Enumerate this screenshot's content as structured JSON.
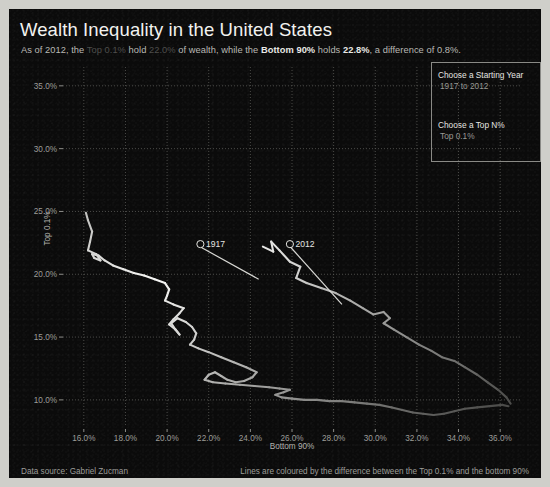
{
  "title": "Wealth Inequality in the United States",
  "subtitle": {
    "p1": "As of 2012, the ",
    "dim1": "Top 0.1%",
    "p2": " hold ",
    "dim2": "22.0%",
    "p3": " of wealth, while the ",
    "bold1": "Bottom 90%",
    "p4": " holds ",
    "bold2": "22.8%",
    "p5": ", a difference of 0.8%."
  },
  "controls": {
    "year_label": "Choose a Starting Year",
    "year_value": "1917 to 2012",
    "topn_label": "Choose a Top N%",
    "topn_value": "Top 0.1%"
  },
  "footer": {
    "left": "Data source: Gabriel Zucman",
    "right": "Lines are coloured by the difference between the Top 0.1% and the bottom 90%"
  },
  "colors": {
    "background": "#0b0b0b",
    "frame": "#cfcfca",
    "grid": "#5a5a57",
    "line_bright": "#f6f6f3",
    "line_dim": "#4a4a48",
    "text": "#e6e6e2",
    "muted": "#9d9d99"
  },
  "chart_data": {
    "type": "line",
    "title": "Wealth Inequality in the United States",
    "xlabel": "Bottom 90%",
    "ylabel": "Top 0.1%",
    "xlim": [
      15.0,
      37.0
    ],
    "ylim": [
      8.0,
      36.5
    ],
    "xticks": [
      "16.0%",
      "18.0%",
      "20.0%",
      "22.0%",
      "24.0%",
      "26.0%",
      "28.0%",
      "30.0%",
      "32.0%",
      "34.0%",
      "36.0%"
    ],
    "xtickvals": [
      16,
      18,
      20,
      22,
      24,
      26,
      28,
      30,
      32,
      34,
      36
    ],
    "yticks": [
      "35.0%",
      "30.0%",
      "25.0%",
      "20.0%",
      "15.0%",
      "10.0%"
    ],
    "ytickvals": [
      35,
      30,
      25,
      20,
      15,
      10
    ],
    "grid": true,
    "legend": "none",
    "series_note": "Connected scatter: each point is one year 1917-2012. x = Bottom 90% share of wealth, y = Top 0.1% share of wealth.",
    "annotations": [
      {
        "label": "1917",
        "x": 21.6,
        "y": 22.4,
        "point_x": 24.4,
        "point_y": 19.6
      },
      {
        "label": "2012",
        "x": 25.9,
        "y": 22.4,
        "point_x": 28.4,
        "point_y": 17.6
      }
    ],
    "points": [
      [
        16.1,
        24.9
      ],
      [
        16.2,
        24.3
      ],
      [
        16.4,
        23.4
      ],
      [
        16.3,
        22.6
      ],
      [
        16.2,
        21.9
      ],
      [
        16.6,
        21.6
      ],
      [
        16.8,
        21.1
      ],
      [
        16.5,
        21.3
      ],
      [
        16.4,
        21.6
      ],
      [
        16.7,
        21.5
      ],
      [
        17.0,
        21.1
      ],
      [
        17.4,
        20.7
      ],
      [
        17.9,
        20.4
      ],
      [
        18.4,
        20.1
      ],
      [
        18.9,
        19.9
      ],
      [
        19.4,
        19.6
      ],
      [
        19.9,
        19.3
      ],
      [
        20.1,
        18.8
      ],
      [
        20.0,
        18.3
      ],
      [
        19.9,
        17.9
      ],
      [
        20.3,
        17.6
      ],
      [
        20.8,
        17.3
      ],
      [
        20.6,
        16.9
      ],
      [
        20.3,
        16.4
      ],
      [
        20.1,
        16.0
      ],
      [
        20.4,
        15.6
      ],
      [
        20.6,
        15.2
      ],
      [
        20.4,
        15.6
      ],
      [
        20.2,
        16.1
      ],
      [
        20.5,
        16.5
      ],
      [
        20.9,
        16.2
      ],
      [
        21.2,
        15.8
      ],
      [
        21.4,
        15.3
      ],
      [
        21.3,
        14.8
      ],
      [
        21.1,
        14.4
      ],
      [
        21.5,
        14.1
      ],
      [
        22.0,
        13.8
      ],
      [
        22.6,
        13.4
      ],
      [
        23.2,
        13.0
      ],
      [
        23.8,
        12.6
      ],
      [
        24.3,
        12.2
      ],
      [
        24.1,
        11.8
      ],
      [
        23.7,
        11.5
      ],
      [
        23.3,
        11.4
      ],
      [
        22.9,
        11.6
      ],
      [
        22.6,
        11.9
      ],
      [
        22.3,
        12.2
      ],
      [
        22.0,
        12.0
      ],
      [
        21.8,
        11.6
      ],
      [
        22.2,
        11.4
      ],
      [
        22.8,
        11.3
      ],
      [
        23.5,
        11.2
      ],
      [
        24.2,
        11.1
      ],
      [
        24.9,
        11.0
      ],
      [
        25.4,
        10.9
      ],
      [
        25.9,
        10.8
      ],
      [
        25.6,
        10.6
      ],
      [
        25.2,
        10.4
      ],
      [
        25.5,
        10.2
      ],
      [
        26.0,
        10.1
      ],
      [
        26.6,
        10.0
      ],
      [
        27.2,
        10.0
      ],
      [
        27.8,
        9.9
      ],
      [
        28.4,
        9.9
      ],
      [
        29.0,
        9.8
      ],
      [
        29.6,
        9.7
      ],
      [
        30.2,
        9.6
      ],
      [
        30.8,
        9.4
      ],
      [
        31.3,
        9.2
      ],
      [
        31.8,
        9.0
      ],
      [
        32.3,
        8.9
      ],
      [
        32.8,
        8.8
      ],
      [
        33.3,
        8.9
      ],
      [
        33.8,
        9.1
      ],
      [
        34.3,
        9.3
      ],
      [
        34.9,
        9.4
      ],
      [
        35.5,
        9.5
      ],
      [
        36.1,
        9.6
      ],
      [
        36.4,
        9.5
      ],
      [
        24.6,
        22.2
      ],
      [
        25.1,
        21.8
      ],
      [
        25.0,
        22.6
      ],
      [
        25.4,
        21.9
      ],
      [
        25.9,
        21.0
      ],
      [
        26.4,
        20.6
      ],
      [
        26.2,
        19.7
      ],
      [
        26.7,
        19.3
      ],
      [
        27.4,
        18.9
      ],
      [
        28.1,
        18.5
      ],
      [
        28.8,
        17.9
      ],
      [
        29.4,
        17.3
      ],
      [
        29.9,
        16.8
      ],
      [
        30.4,
        17.0
      ],
      [
        30.7,
        16.5
      ],
      [
        30.4,
        16.1
      ],
      [
        30.9,
        15.6
      ],
      [
        31.5,
        15.0
      ],
      [
        32.1,
        14.4
      ],
      [
        32.7,
        13.9
      ],
      [
        33.2,
        13.4
      ],
      [
        33.8,
        13.1
      ],
      [
        34.3,
        12.6
      ],
      [
        34.9,
        12.0
      ],
      [
        35.4,
        11.4
      ],
      [
        35.9,
        10.8
      ],
      [
        36.3,
        10.2
      ],
      [
        36.5,
        9.7
      ]
    ]
  }
}
